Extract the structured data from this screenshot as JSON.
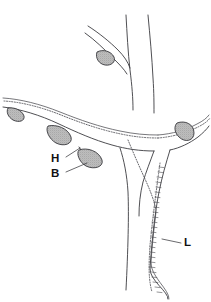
{
  "figure": {
    "background_color": "#ffffff",
    "line_color": "#3b3b3f",
    "nodule_fill_color": "#b9b9b9",
    "nodule_outline_color": "#2e2e33",
    "label_color": "#111114"
  },
  "labels": [
    {
      "id": "label-h",
      "text": "H",
      "x": 57,
      "y": 159,
      "leader_from": [
        66,
        157
      ],
      "leader_to": [
        80,
        148
      ]
    },
    {
      "id": "label-b",
      "text": "B",
      "x": 57,
      "y": 174,
      "leader_from": [
        66,
        172
      ],
      "leader_to": [
        87,
        163
      ]
    },
    {
      "id": "label-l",
      "text": "L",
      "x": 185,
      "y": 243,
      "leader_from": [
        181,
        243
      ],
      "leader_to": [
        162,
        239
      ]
    }
  ],
  "features": {
    "nodules": [
      {
        "id": "nodule-upper-branch",
        "cx": 105,
        "cy": 58,
        "rx": 9,
        "ry": 6,
        "rotation": -28
      },
      {
        "id": "nodule-left-edge",
        "cx": 16,
        "cy": 114,
        "rx": 8,
        "ry": 5.5,
        "rotation": -18
      },
      {
        "id": "nodule-mid-left",
        "cx": 59,
        "cy": 132,
        "rx": 11,
        "ry": 7,
        "rotation": -8
      },
      {
        "id": "nodule-lower-spur",
        "cx": 90,
        "cy": 155,
        "rx": 11,
        "ry": 7.5,
        "rotation": 0
      },
      {
        "id": "nodule-right",
        "cx": 184,
        "cy": 130,
        "rx": 9.5,
        "ry": 8,
        "rotation": 14
      }
    ],
    "stipple_paths": [
      "left-horizontal-upper-margin",
      "right-horizontal-upper-margin",
      "central-descending-margin",
      "lower-right-ladder"
    ],
    "ladder_rung_count": 26
  },
  "legend": {
    "h_meaning": "H",
    "b_meaning": "B",
    "l_meaning": "L"
  }
}
